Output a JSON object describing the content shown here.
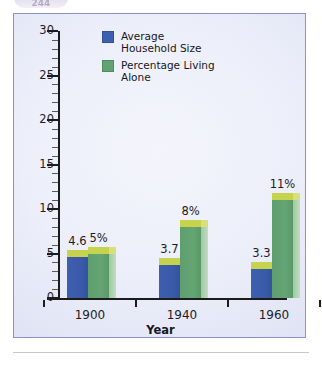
{
  "page_tab": {
    "label": "244"
  },
  "chart_data": {
    "type": "bar",
    "title": "",
    "subtitle": "",
    "xlabel": "Year",
    "ylabel": "",
    "categories": [
      "1900",
      "1940",
      "1960",
      "1980",
      "2012"
    ],
    "ylim": [
      0,
      30
    ],
    "yticks": [
      0,
      5,
      10,
      15,
      20,
      25,
      30
    ],
    "ytick_labels": [
      "0",
      "5",
      "10",
      "15",
      "20",
      "25",
      "30"
    ],
    "grid": false,
    "legend_position": "top-center",
    "series": [
      {
        "name": "Average\nHousehold Size",
        "color": "#3d5faf",
        "values": [
          4.6,
          3.7,
          3.3,
          2.8,
          2.6
        ],
        "labels": [
          "4.6",
          "3.7",
          "3.3",
          "2.8",
          "2.6"
        ]
      },
      {
        "name": "Percentage Living\nAlone",
        "color": "#62a171",
        "values": [
          5,
          8,
          11,
          23,
          28
        ],
        "labels": [
          "5%",
          "8%",
          "11%",
          "23%",
          "28%"
        ]
      }
    ]
  }
}
